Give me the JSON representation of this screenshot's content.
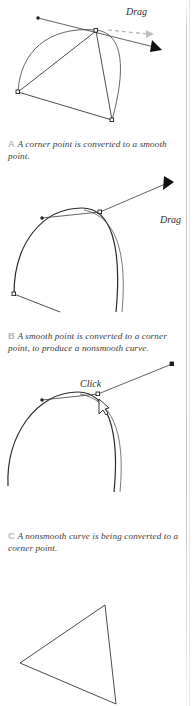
{
  "page": {
    "background": "#ffffff",
    "width": 196,
    "height": 706
  },
  "colors": {
    "stroke": "#3a3a3a",
    "curve": "#2b2b2b",
    "caption_text": "#3b3b3b",
    "caption_letter": "#b9b9b9",
    "label_text": "#2e2e2e",
    "rule": "#c8c8c8"
  },
  "figures": [
    {
      "id": "figure-a",
      "letter": "A",
      "label": "Drag",
      "description": "Corner point being dragged into a smooth point with tangent handles and dashed motion arrow."
    },
    {
      "id": "figure-b",
      "letter": "B",
      "label": "Drag",
      "description": "Smooth point being dragged to break the tangent into a corner point producing a nonsmooth curve."
    },
    {
      "id": "figure-c",
      "letter": "C",
      "label": "Click",
      "description": "Nonsmooth curve with cursor clicking the anchor point to convert it to a corner point."
    },
    {
      "id": "figure-d",
      "letter": "",
      "label": "",
      "description": "Resulting straight-sided triangle shape with corner points."
    }
  ],
  "captions": [
    {
      "letter": "A",
      "text": "A corner point is converted to a smooth point."
    },
    {
      "letter": "B",
      "text": "A smooth point is converted to a corner point, to produce a nonsmooth curve."
    },
    {
      "letter": "C",
      "text": "A nonsmooth curve is being converted to a corner point."
    }
  ],
  "labels": {
    "drag_a": "Drag",
    "drag_b": "Drag",
    "click_c": "Click"
  }
}
